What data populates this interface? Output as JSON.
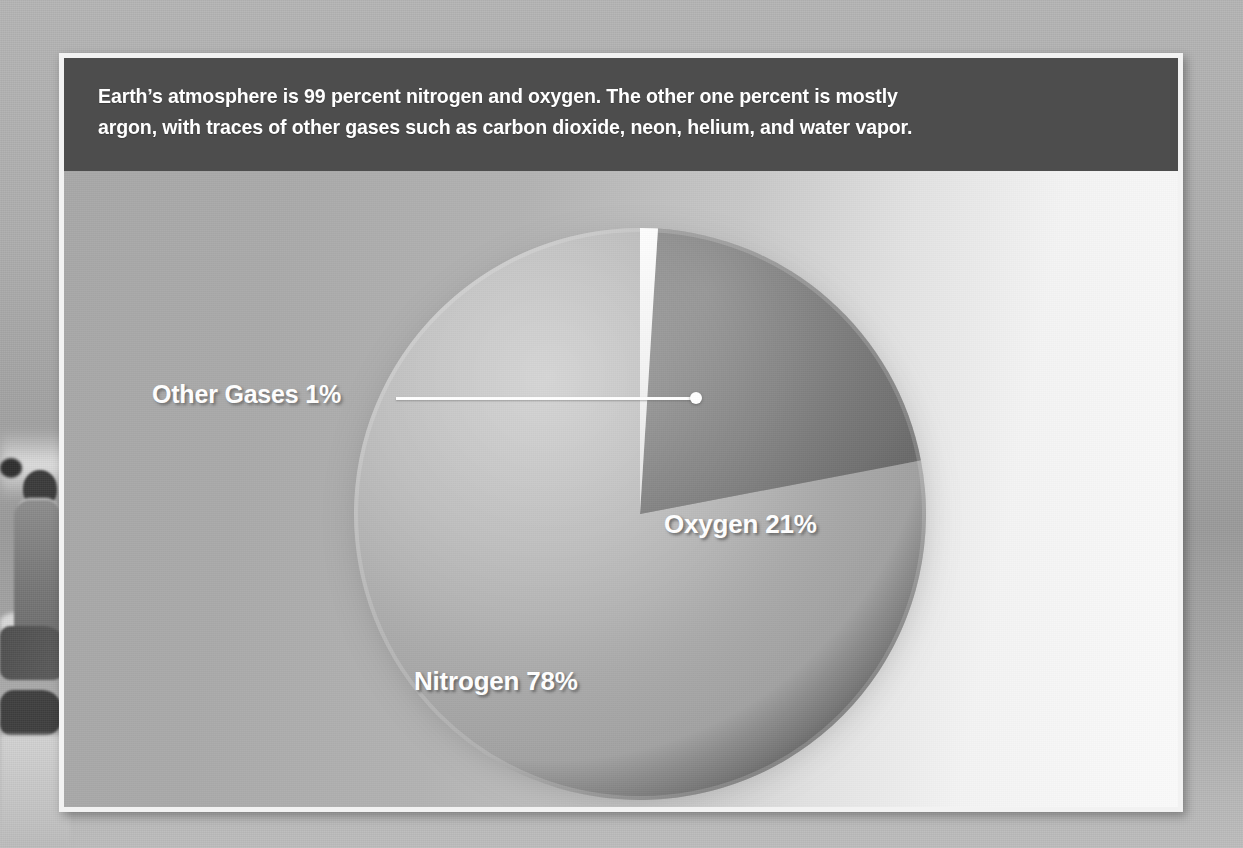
{
  "caption": {
    "text": "Earth’s atmosphere is 99 percent nitrogen and oxygen. The other one percent is mostly\nargon, with traces of other gases such as carbon dioxide, neon, helium, and water vapor."
  },
  "labels": {
    "nitrogen": "Nitrogen 78%",
    "oxygen": "Oxygen 21%",
    "other": "Other Gases 1%"
  },
  "colors": {
    "caption_bar": "#4d4d4d",
    "frame": "#f2f2f2",
    "nitrogen_slice": "#a9a9a9",
    "oxygen_slice": "#767676",
    "other_slice": "#f0f0f0",
    "label_text": "#ffffff",
    "leader_line": "#ffffff"
  },
  "chart_data": {
    "type": "pie",
    "title": "Earth’s atmosphere is 99 percent nitrogen and oxygen. The other one percent is mostly argon, with traces of other gases such as carbon dioxide, neon, helium, and water vapor.",
    "xlabel": "",
    "ylabel": "",
    "unit": "percent",
    "start_angle_deg": 0,
    "direction": "clockwise",
    "legend": "none",
    "grid": false,
    "labels_inside": true,
    "categories": [
      "Other Gases",
      "Oxygen",
      "Nitrogen"
    ],
    "values": [
      1,
      21,
      78
    ],
    "slices": [
      {
        "name": "Other Gases",
        "value": 1,
        "display_label": "Other Gases 1%",
        "color": "#f0f0f0",
        "start_angle_deg": 0,
        "end_angle_deg": 3.6,
        "label_placement": "outside-leader-line"
      },
      {
        "name": "Oxygen",
        "value": 21,
        "display_label": "Oxygen 21%",
        "color": "#767676",
        "start_angle_deg": 3.6,
        "end_angle_deg": 79.2,
        "label_placement": "inside"
      },
      {
        "name": "Nitrogen",
        "value": 78,
        "display_label": "Nitrogen 78%",
        "color": "#a9a9a9",
        "start_angle_deg": 79.2,
        "end_angle_deg": 360,
        "label_placement": "inside"
      }
    ]
  }
}
